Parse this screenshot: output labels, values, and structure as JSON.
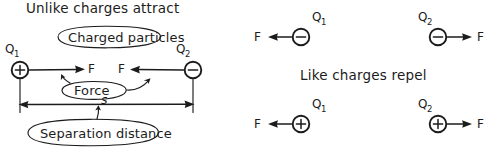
{
  "figure": {
    "kind": "hand-drawn-physics-diagram",
    "ink_color": "#1c1c1c",
    "background": "#ffffff"
  },
  "panels": {
    "attract": {
      "title": "Unlike charges attract",
      "callouts": {
        "particles": "Charged particles",
        "force": "Force",
        "separation": "Separation distance"
      },
      "distance_symbol": "s",
      "left_charge": {
        "name": "Q",
        "subscript": "1",
        "sign": "+",
        "force_label": "F",
        "force_direction": "right"
      },
      "right_charge": {
        "name": "Q",
        "subscript": "2",
        "sign": "−",
        "force_label": "F",
        "force_direction": "left"
      }
    },
    "repel": {
      "title": "Like charges repel",
      "negative_pair": {
        "left_charge": {
          "name": "Q",
          "subscript": "1",
          "sign": "−",
          "force_label": "F",
          "force_direction": "left"
        },
        "right_charge": {
          "name": "Q",
          "subscript": "2",
          "sign": "−",
          "force_label": "F",
          "force_direction": "right"
        }
      },
      "positive_pair": {
        "left_charge": {
          "name": "Q",
          "subscript": "1",
          "sign": "+",
          "force_label": "F",
          "force_direction": "left"
        },
        "right_charge": {
          "name": "Q",
          "subscript": "2",
          "sign": "+",
          "force_label": "F",
          "force_direction": "right"
        }
      }
    }
  }
}
